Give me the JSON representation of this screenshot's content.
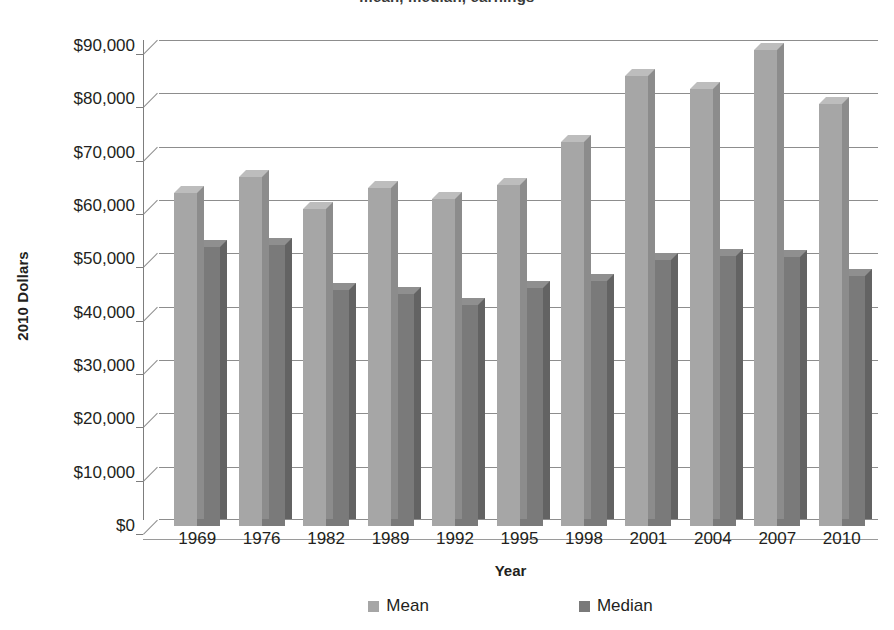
{
  "title_remnant": "mean, median, earnings",
  "axes": {
    "y_title": "2010 Dollars",
    "x_title": "Year",
    "y_ticks": [
      "$0",
      "$10,000",
      "$20,000",
      "$30,000",
      "$40,000",
      "$50,000",
      "$60,000",
      "$70,000",
      "$80,000",
      "$90,000"
    ]
  },
  "legend": {
    "items": [
      {
        "label": "Mean",
        "color": "#a6a6a6"
      },
      {
        "label": "Median",
        "color": "#7a7a7a"
      }
    ]
  },
  "chart_data": {
    "type": "bar",
    "title": "",
    "xlabel": "Year",
    "ylabel": "2010 Dollars",
    "ylim": [
      0,
      90000
    ],
    "ytick_step": 10000,
    "grid": true,
    "legend_position": "bottom",
    "style": "3d-clustered-column",
    "categories": [
      "1969",
      "1976",
      "1982",
      "1989",
      "1992",
      "1995",
      "1998",
      "2001",
      "2004",
      "2007",
      "2010"
    ],
    "series": [
      {
        "name": "Mean",
        "color": "#a6a6a6",
        "values": [
          62500,
          65400,
          59500,
          63300,
          61400,
          64000,
          72000,
          84300,
          82000,
          89200,
          79200
        ]
      },
      {
        "name": "Median",
        "color": "#7a7a7a",
        "values": [
          52400,
          52600,
          44300,
          43500,
          41500,
          44600,
          45900,
          49900,
          50700,
          50500,
          46800
        ]
      }
    ]
  }
}
